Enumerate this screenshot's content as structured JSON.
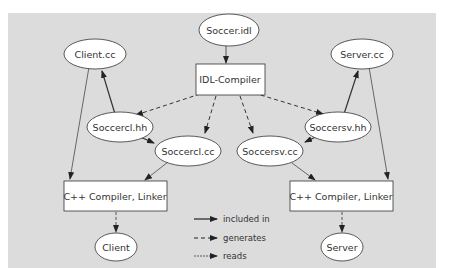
{
  "diagram": {
    "type": "build-dependency-graph",
    "background": "#dcdcdc",
    "nodes": [
      {
        "id": "soccer_idl",
        "label": "Soccer.idl",
        "shape": "ellipse"
      },
      {
        "id": "idl_compiler",
        "label": "IDL-Compiler",
        "shape": "box"
      },
      {
        "id": "client_cc",
        "label": "Client.cc",
        "shape": "ellipse"
      },
      {
        "id": "server_cc",
        "label": "Server.cc",
        "shape": "ellipse"
      },
      {
        "id": "soccercl_hh",
        "label": "Soccercl.hh",
        "shape": "ellipse"
      },
      {
        "id": "soccercl_cc",
        "label": "Soccercl.cc",
        "shape": "ellipse"
      },
      {
        "id": "soccersv_cc",
        "label": "Soccersv.cc",
        "shape": "ellipse"
      },
      {
        "id": "soccersv_hh",
        "label": "Soccersv.hh",
        "shape": "ellipse"
      },
      {
        "id": "cpp_left",
        "label": "C++ Compiler, Linker",
        "shape": "box"
      },
      {
        "id": "cpp_right",
        "label": "C++ Compiler, Linker",
        "shape": "box"
      },
      {
        "id": "client",
        "label": "Client",
        "shape": "ellipse"
      },
      {
        "id": "server",
        "label": "Server",
        "shape": "ellipse"
      }
    ],
    "edges": [
      {
        "from": "soccer_idl",
        "to": "idl_compiler",
        "kind": "reads"
      },
      {
        "from": "idl_compiler",
        "to": "soccercl_hh",
        "kind": "generates"
      },
      {
        "from": "idl_compiler",
        "to": "soccercl_cc",
        "kind": "generates"
      },
      {
        "from": "idl_compiler",
        "to": "soccersv_cc",
        "kind": "generates"
      },
      {
        "from": "idl_compiler",
        "to": "soccersv_hh",
        "kind": "generates"
      },
      {
        "from": "soccercl_hh",
        "to": "client_cc",
        "kind": "included in"
      },
      {
        "from": "soccercl_hh",
        "to": "soccercl_cc",
        "kind": "included in"
      },
      {
        "from": "soccersv_hh",
        "to": "server_cc",
        "kind": "included in"
      },
      {
        "from": "soccersv_hh",
        "to": "soccersv_cc",
        "kind": "included in"
      },
      {
        "from": "client_cc",
        "to": "cpp_left",
        "kind": "reads"
      },
      {
        "from": "soccercl_cc",
        "to": "cpp_left",
        "kind": "reads"
      },
      {
        "from": "server_cc",
        "to": "cpp_right",
        "kind": "reads"
      },
      {
        "from": "soccersv_cc",
        "to": "cpp_right",
        "kind": "reads"
      },
      {
        "from": "cpp_left",
        "to": "client",
        "kind": "generates"
      },
      {
        "from": "cpp_right",
        "to": "server",
        "kind": "generates"
      }
    ],
    "legend": [
      {
        "style": "solid",
        "label": "included in"
      },
      {
        "style": "dashed",
        "label": "generates"
      },
      {
        "style": "thin",
        "label": "reads"
      }
    ]
  }
}
